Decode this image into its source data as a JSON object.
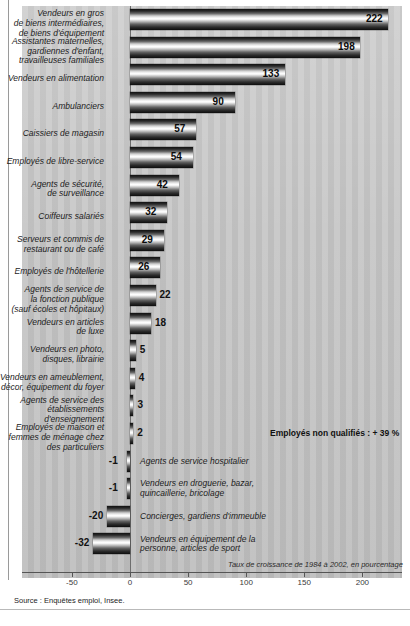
{
  "chart_data": {
    "type": "bar",
    "orientation": "horizontal",
    "title": "",
    "xlabel": "Taux de croissance de 1984 à 2002, en pourcentage",
    "ylabel": "",
    "xlim": [
      -50,
      225
    ],
    "xticks": [
      -50,
      0,
      50,
      100,
      150,
      200
    ],
    "xticklabels": [
      "-50",
      "0",
      "50",
      "100",
      "150",
      "200"
    ],
    "grid": false,
    "legend": null,
    "categories": [
      "Vendeurs en gros\nde biens intermédiaires,\nde biens d'équipement",
      "Assistantes maternelles,\ngardiennes d'enfant,\ntravailleuses familiales",
      "Vendeurs en alimentation",
      "Ambulanciers",
      "Caissiers de magasin",
      "Employés de libre-service",
      "Agents de sécurité,\nde surveillance",
      "Coiffeurs salariés",
      "Serveurs et commis de\nrestaurant ou de café",
      "Employés de l'hôtellerie",
      "Agents de service de\nla fonction publique\n(sauf écoles et hôpitaux)",
      "Vendeurs en articles\nde luxe",
      "Vendeurs en photo,\ndisques, librairie",
      "Vendeurs en ameublement,\ndécor, équipement du foyer",
      "Agents de service des\nétablissements\nd'enseignement",
      "Employés de maison et\nfemmes de ménage chez\ndes particuliers",
      "Agents de service hospitalier",
      "Vendeurs en droguerie, bazar,\nquincaillerie, bricolage",
      "Concierges, gardiens d'immeuble",
      "Vendeurs en équipement de la\npersonne, articles de sport"
    ],
    "values": [
      222,
      198,
      133,
      90,
      57,
      54,
      42,
      32,
      29,
      26,
      22,
      18,
      5,
      4,
      3,
      2,
      -1,
      -1,
      -20,
      -32
    ],
    "value_labels": [
      "222",
      "198",
      "133",
      "90",
      "57",
      "54",
      "42",
      "32",
      "29",
      "26",
      "22",
      "18",
      "5",
      "4",
      "3",
      "2",
      "-1",
      "-1",
      "-20",
      "-32"
    ],
    "annotations": [
      {
        "text": "Employés non qualifiés : + 39 %",
        "bold": true
      }
    ]
  },
  "footer": {
    "source": "Source : Enquêtes emploi, Insee."
  },
  "colors": {
    "background": "#ffffff",
    "plot_stripe_light": "#c9c9c9",
    "plot_stripe_dark": "#bdbdbd",
    "axis": "#555555",
    "text": "#1d1d1d"
  }
}
